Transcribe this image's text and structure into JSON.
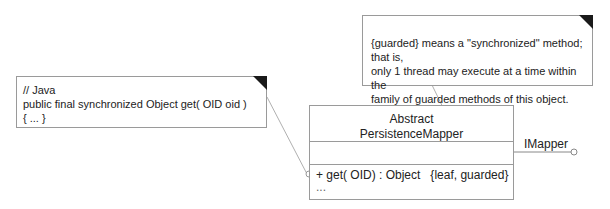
{
  "notes": {
    "guarded_note": {
      "lines": [
        "{guarded} means a \"synchronized\" method; that is,",
        "only 1 thread may execute at a time within the",
        "family of guarded methods of this object."
      ]
    },
    "java_note": {
      "lines": [
        "// Java",
        "public final synchronized Object get( OID oid )",
        "{ ... }"
      ]
    }
  },
  "class": {
    "name_line1": "Abstract",
    "name_line2": "PersistenceMapper",
    "operations": [
      "+ get( OID) : Object   {leaf, guarded}",
      "..."
    ]
  },
  "interface": {
    "label": "IMapper"
  },
  "colors": {
    "line": "#9a9a9a",
    "fold": "#1a1a1a"
  }
}
